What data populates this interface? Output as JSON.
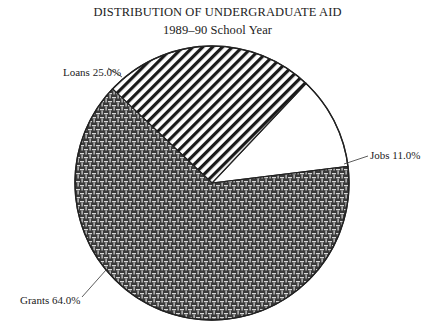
{
  "chart_data": {
    "type": "pie",
    "title": "DISTRIBUTION OF UNDERGRADUATE AID",
    "subtitle": "1989–90 School Year",
    "categories": [
      "Grants",
      "Loans",
      "Jobs"
    ],
    "values": [
      64.0,
      25.0,
      11.0
    ],
    "labels": [
      "Grants 64.0%",
      "Loans 25.0%",
      "Jobs 11.0%"
    ],
    "fills": [
      "crosshatch-weave dark",
      "diagonal stripes",
      "white"
    ],
    "legend": "none (direct labels with leader lines)"
  }
}
